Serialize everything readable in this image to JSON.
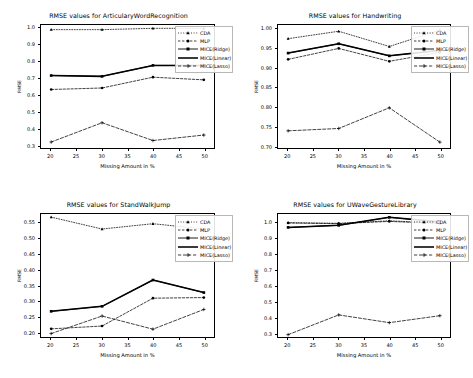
{
  "figure": {
    "background": "#ffffff",
    "series_styles": [
      {
        "name": "CDA",
        "color": "#000000",
        "dash": "1,1.6",
        "marker": "triangle",
        "width": 0.75
      },
      {
        "name": "MLP",
        "color": "#000000",
        "dash": "2.4,1.6",
        "marker": "circle",
        "width": 0.75
      },
      {
        "name": "MICE(Ridge)",
        "color": "#000000",
        "dash": "none",
        "marker": "square",
        "width": 0.9
      },
      {
        "name": "MICE(Linear)",
        "color": "#000000",
        "dash": "none",
        "marker": "none",
        "width": 1.55
      },
      {
        "name": "MICE(Lasso)",
        "color": "#000000",
        "dash": "3.2,1.8",
        "marker": "plus",
        "width": 0.75
      }
    ]
  },
  "chart_data": [
    {
      "id": "articulary-word-recognition",
      "type": "line",
      "title": "RMSE values for ArticularyWordRecognition",
      "xlabel": "Missing Amount in %",
      "ylabel": "RMSE",
      "x": [
        20,
        30,
        40,
        50
      ],
      "xlim": [
        18,
        52
      ],
      "ylim": [
        0.28,
        1.02
      ],
      "xticks": [
        20,
        25,
        30,
        35,
        40,
        45,
        50
      ],
      "xticklabels": [
        "20",
        "25",
        "30",
        "35",
        "40",
        "45",
        "50"
      ],
      "yticks": [
        0.3,
        0.4,
        0.5,
        0.6,
        0.7,
        0.8,
        0.9,
        1.0
      ],
      "yticklabels": [
        "0.3",
        "0.4",
        "0.5",
        "0.6",
        "0.7",
        "0.8",
        "0.9",
        "1.0"
      ],
      "grid": false,
      "legend_position": "upper right",
      "series": [
        {
          "name": "CDA",
          "values": [
            0.992,
            0.992,
            1.0,
            1.0
          ]
        },
        {
          "name": "MLP",
          "values": [
            0.632,
            0.641,
            0.706,
            0.69
          ]
        },
        {
          "name": "MICE(Ridge)",
          "values": [
            0.716,
            0.711,
            0.777,
            0.777
          ]
        },
        {
          "name": "MICE(Linear)",
          "values": [
            0.716,
            0.711,
            0.777,
            0.777
          ]
        },
        {
          "name": "MICE(Lasso)",
          "values": [
            0.316,
            0.432,
            0.325,
            0.358
          ]
        }
      ]
    },
    {
      "id": "handwriting",
      "type": "line",
      "title": "RMSE values for Handwriting",
      "xlabel": "Missing Amount in %",
      "ylabel": "RMSE",
      "x": [
        20,
        30,
        40,
        50
      ],
      "xlim": [
        18,
        52
      ],
      "ylim": [
        0.695,
        1.01
      ],
      "xticks": [
        20,
        25,
        30,
        35,
        40,
        45,
        50
      ],
      "xticklabels": [
        "20",
        "25",
        "30",
        "35",
        "40",
        "45",
        "50"
      ],
      "yticks": [
        0.7,
        0.75,
        0.8,
        0.85,
        0.9,
        0.95,
        1.0
      ],
      "yticklabels": [
        "0.70",
        "0.75",
        "0.80",
        "0.85",
        "0.90",
        "0.95",
        "1.00"
      ],
      "grid": false,
      "legend_position": "upper right",
      "series": [
        {
          "name": "CDA",
          "values": [
            0.975,
            0.994,
            0.955,
            0.997
          ]
        },
        {
          "name": "MLP",
          "values": [
            0.922,
            0.95,
            0.917,
            0.94
          ]
        },
        {
          "name": "MICE(Ridge)",
          "values": [
            0.938,
            0.962,
            0.931,
            0.945
          ]
        },
        {
          "name": "MICE(Linear)",
          "values": [
            0.938,
            0.962,
            0.931,
            0.945
          ]
        },
        {
          "name": "MICE(Lasso)",
          "values": [
            0.739,
            0.745,
            0.798,
            0.71
          ]
        }
      ]
    },
    {
      "id": "stand-walk-jump",
      "type": "line",
      "title": "RMSE values for StandWalkJump",
      "xlabel": "Missing Amount in %",
      "ylabel": "RMSE",
      "x": [
        20,
        30,
        40,
        50
      ],
      "xlim": [
        18,
        52
      ],
      "ylim": [
        0.185,
        0.578
      ],
      "xticks": [
        20,
        25,
        30,
        35,
        40,
        45,
        50
      ],
      "xticklabels": [
        "20",
        "25",
        "30",
        "35",
        "40",
        "45",
        "50"
      ],
      "yticks": [
        0.2,
        0.25,
        0.3,
        0.35,
        0.4,
        0.45,
        0.5,
        0.55
      ],
      "yticklabels": [
        "0.20",
        "0.25",
        "0.30",
        "0.35",
        "0.40",
        "0.45",
        "0.50",
        "0.55"
      ],
      "grid": false,
      "legend_position": "upper right",
      "series": [
        {
          "name": "CDA",
          "values": [
            0.568,
            0.53,
            0.547,
            0.53
          ]
        },
        {
          "name": "MLP",
          "values": [
            0.211,
            0.22,
            0.309,
            0.311
          ]
        },
        {
          "name": "MICE(Ridge)",
          "values": [
            0.267,
            0.283,
            0.367,
            0.327
          ]
        },
        {
          "name": "MICE(Linear)",
          "values": [
            0.267,
            0.283,
            0.367,
            0.327
          ]
        },
        {
          "name": "MICE(Lasso)",
          "values": [
            0.196,
            0.252,
            0.21,
            0.273
          ]
        }
      ]
    },
    {
      "id": "uwave-gesture-library",
      "type": "line",
      "title": "RMSE values for UWaveGestureLibrary",
      "xlabel": "Missing Amount in %",
      "ylabel": "RMSE",
      "x": [
        20,
        30,
        40,
        50
      ],
      "xlim": [
        18,
        52
      ],
      "ylim": [
        0.275,
        1.055
      ],
      "xticks": [
        20,
        25,
        30,
        35,
        40,
        45,
        50
      ],
      "xticklabels": [
        "20",
        "25",
        "30",
        "35",
        "40",
        "45",
        "50"
      ],
      "yticks": [
        0.3,
        0.4,
        0.5,
        0.6,
        0.7,
        0.8,
        0.9,
        1.0
      ],
      "yticklabels": [
        "0.3",
        "0.4",
        "0.5",
        "0.6",
        "0.7",
        "0.8",
        "0.9",
        "1.0"
      ],
      "grid": false,
      "legend_position": "upper right",
      "series": [
        {
          "name": "CDA",
          "values": [
            1.0,
            0.996,
            1.012,
            0.997
          ]
        },
        {
          "name": "MLP",
          "values": [
            0.998,
            0.994,
            1.008,
            0.995
          ]
        },
        {
          "name": "MICE(Ridge)",
          "values": [
            0.97,
            0.983,
            1.034,
            1.005
          ]
        },
        {
          "name": "MICE(Linear)",
          "values": [
            0.97,
            0.983,
            1.034,
            1.005
          ]
        },
        {
          "name": "MICE(Lasso)",
          "values": [
            0.29,
            0.415,
            0.366,
            0.41
          ]
        }
      ]
    }
  ]
}
